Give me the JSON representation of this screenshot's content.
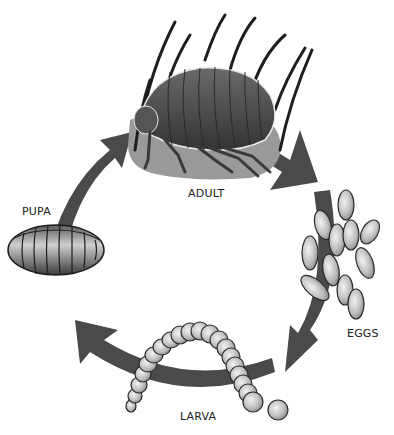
{
  "diagram": {
    "stages": [
      {
        "id": "adult",
        "label": "ADULT"
      },
      {
        "id": "eggs",
        "label": "EGGS"
      },
      {
        "id": "larva",
        "label": "LARVA"
      },
      {
        "id": "pupa",
        "label": "PUPA"
      }
    ],
    "colors": {
      "arrow": "#4a4a4a",
      "hair": "#1e1e1e",
      "skin_patch": "#9a9a9a",
      "flea_body": "#4c4c4c",
      "egg_fill": "#c8c8c8",
      "outline": "#222222"
    }
  }
}
